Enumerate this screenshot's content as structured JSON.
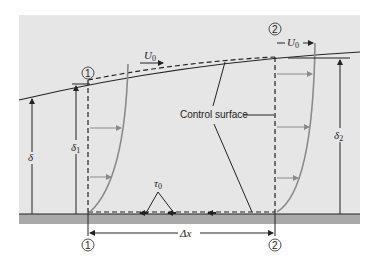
{
  "diagram": {
    "colors": {
      "panel": "#e6e6e6",
      "ground": "#a9a9a9",
      "line": "#222222",
      "profile": "#8a8a8a",
      "arrows": "#8a8a8a"
    },
    "labels": {
      "control_surface": "Control surface",
      "velocity_1": "U",
      "velocity_1_sub": "0",
      "velocity_2": "U",
      "velocity_2_sub": "0",
      "delta": "δ",
      "delta_1": "δ",
      "delta_1_sub": "1",
      "delta_2": "δ",
      "delta_2_sub": "2",
      "shear_stress": "τ",
      "shear_stress_sub": "0",
      "delta_x": "Δx"
    },
    "sections": [
      {
        "id": "1",
        "label": "1"
      },
      {
        "id": "2",
        "label": "2"
      }
    ]
  }
}
